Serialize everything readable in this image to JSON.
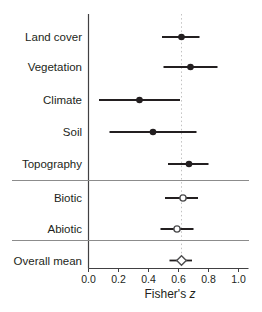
{
  "figure": {
    "background": "#ffffff"
  },
  "style": {
    "ink": "#231f20",
    "axis": "#414042",
    "separator": "#8c8c8c",
    "reference_line": "#c2c2c2",
    "marker_stroke": "#4d4d4f",
    "marker_open_fill": "#ffffff"
  },
  "chart_data": {
    "type": "forest",
    "orientation": "horizontal",
    "title": "",
    "xlabel": "Fisher's z",
    "xlabel_parts": {
      "regular": "Fisher's",
      "italic": "z"
    },
    "xlim": [
      0.0,
      1.0
    ],
    "xtick_values": [
      0.0,
      0.2,
      0.4,
      0.6,
      0.8,
      1.0
    ],
    "xticks": [
      "0.0",
      "0.2",
      "0.4",
      "0.6",
      "0.8",
      "1.0"
    ],
    "grid": false,
    "legend": false,
    "reference_line_x": 0.62,
    "reference_line_style": "dotted",
    "sections": [
      {
        "name": "predictor-categories",
        "rows": [
          {
            "label": "Land cover",
            "mean": 0.62,
            "ci": [
              0.49,
              0.74
            ],
            "marker": "filled-circle"
          },
          {
            "label": "Vegetation",
            "mean": 0.68,
            "ci": [
              0.5,
              0.86
            ],
            "marker": "filled-circle"
          },
          {
            "label": "Climate",
            "mean": 0.34,
            "ci": [
              0.07,
              0.61
            ],
            "marker": "filled-circle"
          },
          {
            "label": "Soil",
            "mean": 0.43,
            "ci": [
              0.14,
              0.72
            ],
            "marker": "filled-circle"
          },
          {
            "label": "Topography",
            "mean": 0.67,
            "ci": [
              0.53,
              0.8
            ],
            "marker": "filled-circle"
          }
        ]
      },
      {
        "name": "factor-groups",
        "rows": [
          {
            "label": "Biotic",
            "mean": 0.63,
            "ci": [
              0.51,
              0.73
            ],
            "marker": "open-circle"
          },
          {
            "label": "Abiotic",
            "mean": 0.59,
            "ci": [
              0.48,
              0.7
            ],
            "marker": "open-circle"
          }
        ]
      },
      {
        "name": "overall",
        "rows": [
          {
            "label": "Overall mean",
            "mean": 0.62,
            "ci": [
              0.54,
              0.69
            ],
            "marker": "open-diamond"
          }
        ]
      }
    ]
  }
}
